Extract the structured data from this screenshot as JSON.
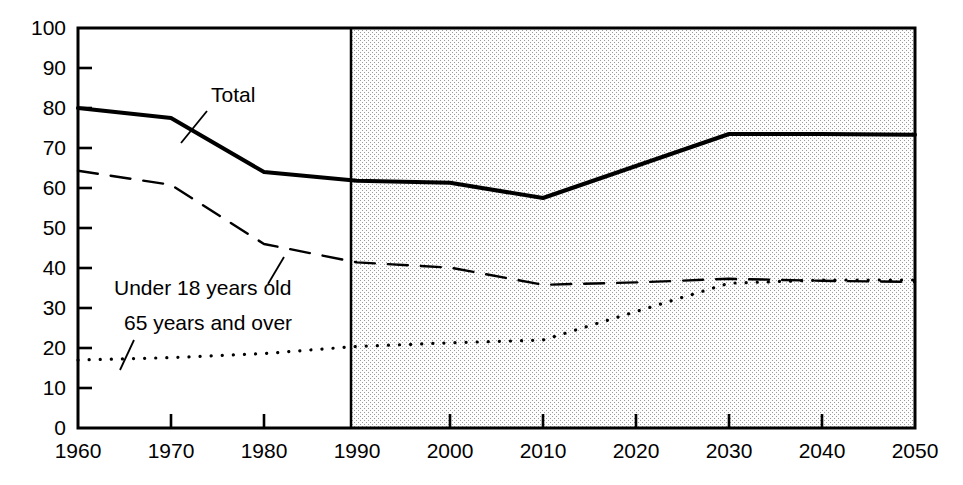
{
  "chart_data": {
    "type": "line",
    "title": "",
    "subtitle": "",
    "xlabel": "",
    "ylabel": "",
    "xlim": [
      1960,
      2050
    ],
    "ylim": [
      0,
      100
    ],
    "grid": false,
    "legend_position": "inline-annotations",
    "x_ticks": [
      1960,
      1970,
      1980,
      1990,
      2000,
      2010,
      2020,
      2030,
      2040,
      2050
    ],
    "x_tick_labels": [
      "1960",
      "1970",
      "1980",
      "1990",
      "2000",
      "2010",
      "2020",
      "2030",
      "2040",
      "2050"
    ],
    "y_ticks": [
      0,
      10,
      20,
      30,
      40,
      50,
      60,
      70,
      80,
      90,
      100
    ],
    "y_tick_labels": [
      "0",
      "10",
      "20",
      "30",
      "40",
      "50",
      "60",
      "70",
      "80",
      "90",
      "100"
    ],
    "x": [
      1960,
      1970,
      1980,
      1990,
      2000,
      2010,
      2020,
      2030,
      2040,
      2050
    ],
    "series": [
      {
        "name": "Total",
        "label": "Total",
        "style": "solid",
        "color": "#000000",
        "width": 4,
        "values": [
          80.0,
          77.5,
          64.0,
          61.8,
          61.3,
          57.5,
          65.5,
          73.5,
          73.5,
          73.3
        ]
      },
      {
        "name": "Under 18 years old",
        "label": "Under 18 years old",
        "style": "dashed",
        "color": "#000000",
        "width": 2.4,
        "values": [
          64.3,
          60.8,
          46.0,
          41.4,
          40.1,
          35.8,
          36.4,
          37.3,
          36.8,
          36.5
        ]
      },
      {
        "name": "65 years and over",
        "label": "65 years and over",
        "style": "dotted",
        "color": "#000000",
        "width": 3.2,
        "values": [
          17.0,
          17.6,
          18.6,
          20.4,
          21.3,
          22.0,
          29.1,
          36.2,
          37.0,
          37.0
        ]
      }
    ],
    "annotations": [
      {
        "name": "total-annotation",
        "text": "Total",
        "text_x": 211,
        "text_y": 102,
        "leader_from_x": 207,
        "leader_from_y": 111,
        "leader_to_x": 181,
        "leader_to_y": 143
      },
      {
        "name": "under-18-annotation",
        "text": "Under 18 years old",
        "text_x": 114,
        "text_y": 295,
        "leader_from_x": 268,
        "leader_from_y": 284,
        "leader_to_x": 284,
        "leader_to_y": 257
      },
      {
        "name": "65-and-over-annotation",
        "text": "65 years and over",
        "text_x": 124,
        "text_y": 330,
        "leader_from_x": 134,
        "leader_from_y": 340,
        "leader_to_x": 120,
        "leader_to_y": 370
      }
    ],
    "projection_region": {
      "name": "projection-shaded-region",
      "start_year": 1990,
      "end_year": 2050,
      "shading": "stipple-dots",
      "shade_color": "#8a8a8a",
      "background": "#fdfdfd"
    },
    "frame": {
      "color": "#000000",
      "plot_left_px": 78,
      "plot_right_px": 915,
      "plot_top_px": 28,
      "plot_bottom_px": 428
    }
  }
}
